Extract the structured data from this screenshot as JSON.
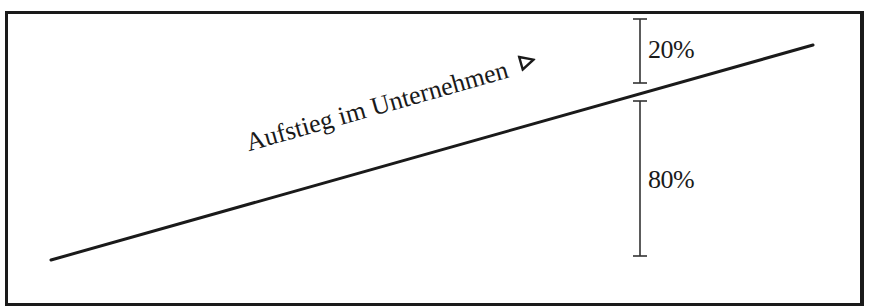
{
  "figure": {
    "line_label": "Aufstieg im Unternehmen",
    "arrow_icon": "triangle-right-outline-icon",
    "upper_segment": {
      "label": "20%",
      "value": 20
    },
    "lower_segment": {
      "label": "80%",
      "value": 80
    }
  },
  "geometry": {
    "line": {
      "x1": 51,
      "y1": 260,
      "x2": 813,
      "y2": 45
    },
    "bracket_x": 640,
    "upper_bracket": {
      "y1": 19,
      "y2": 83
    },
    "lower_bracket": {
      "y1": 101,
      "y2": 256
    }
  },
  "colors": {
    "ink": "#1a1a1a",
    "background": "#ffffff"
  }
}
